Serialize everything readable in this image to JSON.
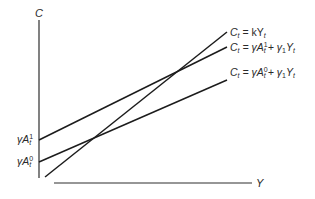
{
  "diagram": {
    "type": "consumption-function-diagram",
    "axes": {
      "y_label": "C",
      "x_label": "Y"
    },
    "lines": [
      {
        "id": "k-line",
        "label_lhs": "C",
        "label_lhs_sub": "t",
        "label_rhs": "= kY",
        "label_rhs_sub": "t"
      },
      {
        "id": "a1-line",
        "label_lhs": "C",
        "label_lhs_sub": "t",
        "label_eq": "= γA",
        "label_sup": "1",
        "label_sub": "t",
        "label_tail": "+ γ",
        "label_tail_sub": "1",
        "label_tail_var": "Y",
        "label_tail_var_sub": "t"
      },
      {
        "id": "a0-line",
        "label_lhs": "C",
        "label_lhs_sub": "t",
        "label_eq": "= γA",
        "label_sup": "0",
        "label_sub": "t",
        "label_tail": "+ γ",
        "label_tail_sub": "1",
        "label_tail_var": "Y",
        "label_tail_var_sub": "t"
      }
    ],
    "intercepts": [
      {
        "id": "intercept-a1",
        "base": "γA",
        "sup": "1",
        "sub": "t"
      },
      {
        "id": "intercept-a0",
        "base": "γA",
        "sup": "0",
        "sub": "t"
      }
    ],
    "colors": {
      "line": "#1c1c1c",
      "text": "#2a2a2a",
      "background": "#ffffff"
    }
  }
}
